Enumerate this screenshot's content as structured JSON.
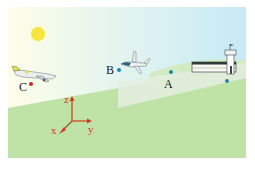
{
  "colors": {
    "sky_left": "#fdfde8",
    "sky_right": "#c9ecf7",
    "ground": "#bfe3a6",
    "ground_far": "#cfe8bd",
    "plane_shadow": "#e3eee0",
    "sun": "#f6e53a",
    "point_red": "#c8282d",
    "point_teal": "#1f8aa6",
    "axis": "#d23a1e",
    "axis_origin": "#6b6b2a"
  },
  "points": [
    {
      "label": "A",
      "color": "teal"
    },
    {
      "label": "B",
      "color": "teal"
    },
    {
      "label": "C",
      "color": "red"
    }
  ],
  "axes": {
    "x": "x",
    "y": "y",
    "z": "z"
  },
  "objects": [
    "sun",
    "airliner",
    "small-jet",
    "airport-terminal",
    "control-tower"
  ]
}
